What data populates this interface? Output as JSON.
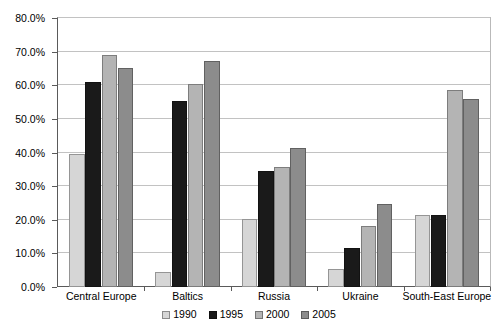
{
  "chart_data": {
    "type": "bar",
    "title": "",
    "subtitle": "",
    "xlabel": "",
    "ylabel": "",
    "categories": [
      "Central Europe",
      "Baltics",
      "Russia",
      "Ukraine",
      "South-East Europe"
    ],
    "series": [
      {
        "name": "1990",
        "color": "#d6d6d6",
        "values": [
          39.5,
          4.5,
          20.2,
          5.5,
          21.5
        ]
      },
      {
        "name": "1995",
        "color": "#1a1a1a",
        "values": [
          61.0,
          55.2,
          34.6,
          11.6,
          21.5
        ]
      },
      {
        "name": "2000",
        "color": "#b4b4b4",
        "values": [
          69.0,
          60.3,
          35.6,
          18.0,
          58.5
        ]
      },
      {
        "name": "2005",
        "color": "#8c8c8c",
        "values": [
          65.0,
          67.3,
          41.2,
          24.6,
          56.0
        ]
      }
    ],
    "ylim": [
      0,
      80
    ],
    "ytick_step": 10,
    "ytick_labels": [
      "0.0%",
      "10.0%",
      "20.0%",
      "30.0%",
      "40.0%",
      "50.0%",
      "60.0%",
      "70.0%",
      "80.0%"
    ],
    "ytick_values": [
      0,
      10,
      20,
      30,
      40,
      50,
      60,
      70,
      80
    ],
    "grid": true,
    "grid_axis": "y",
    "grid_color": "#c2c2c2",
    "legend": true,
    "legend_position": "bottom",
    "plot_background": "#ffffff",
    "axis_color": "#5a5a5a"
  }
}
